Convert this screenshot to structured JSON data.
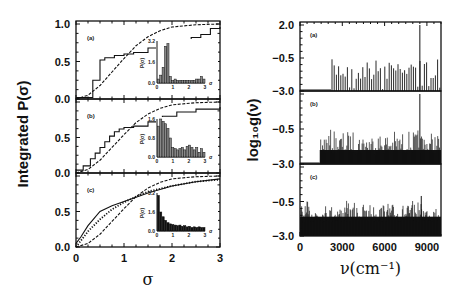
{
  "chart_data": [
    {
      "type": "line",
      "title": "",
      "xlabel": "σ",
      "ylabel": "Integrated P(σ)",
      "xlim": [
        0,
        3
      ],
      "ylim": [
        0,
        1
      ],
      "x_ticks": [
        "0",
        "1",
        "2",
        "3"
      ],
      "y_ticks": [
        "0.0",
        "0.5",
        "1.0"
      ],
      "grid": false,
      "panels": [
        {
          "label": "(a)",
          "series": [
            {
              "name": "integrated distribution (step)",
              "style": "step",
              "x": [
                0,
                0.2,
                0.35,
                0.5,
                0.6,
                0.8,
                1.0,
                1.2,
                1.5,
                1.8,
                2.1,
                2.4,
                2.6,
                2.8,
                3.0
              ],
              "y": [
                0.02,
                0.02,
                0.25,
                0.52,
                0.55,
                0.58,
                0.6,
                0.62,
                0.68,
                0.72,
                0.78,
                0.82,
                0.86,
                0.94,
                0.96
              ]
            },
            {
              "name": "Wigner reference (dashed)",
              "style": "dashed",
              "x": [
                0,
                0.25,
                0.5,
                0.75,
                1.0,
                1.25,
                1.5,
                1.75,
                2.0,
                2.5,
                3.0
              ],
              "y": [
                0,
                0.05,
                0.18,
                0.36,
                0.54,
                0.71,
                0.83,
                0.91,
                0.96,
                0.99,
                1.0
              ]
            }
          ],
          "inset": {
            "ylabel": "P(σ)",
            "xlabel": "σ",
            "y_ticks": [
              "0.0",
              "1.6",
              "3.2"
            ],
            "x_ticks": [
              "0",
              "1",
              "2",
              "3"
            ],
            "bars": [
              0.3,
              0.6,
              1.2,
              2.8,
              3.0,
              0.5,
              0.2,
              0.3,
              0.2,
              0.2,
              0.2,
              0.2,
              0.2,
              0.2,
              0.2,
              0.2,
              0.3,
              0.3,
              0.5,
              0.3
            ]
          }
        },
        {
          "label": "(b)",
          "series": [
            {
              "name": "integrated distribution (step)",
              "style": "step",
              "x": [
                0,
                0.15,
                0.3,
                0.4,
                0.5,
                0.6,
                0.7,
                0.8,
                0.9,
                1.0,
                1.2,
                1.5,
                1.8,
                2.1,
                2.5,
                3.0
              ],
              "y": [
                0.04,
                0.1,
                0.2,
                0.28,
                0.36,
                0.44,
                0.52,
                0.58,
                0.62,
                0.64,
                0.66,
                0.72,
                0.8,
                0.86,
                0.9,
                0.93
              ]
            },
            {
              "name": "Wigner reference (dashed)",
              "style": "dashed",
              "x": [
                0,
                0.25,
                0.5,
                0.75,
                1.0,
                1.25,
                1.5,
                1.75,
                2.0,
                2.5,
                3.0
              ],
              "y": [
                0,
                0.05,
                0.18,
                0.36,
                0.54,
                0.71,
                0.83,
                0.91,
                0.96,
                0.99,
                1.0
              ]
            }
          ],
          "inset": {
            "ylabel": "P(σ)",
            "xlabel": "σ",
            "y_ticks": [
              "0.0",
              "0.8",
              "1.6"
            ],
            "x_ticks": [
              "0",
              "1",
              "2",
              "3"
            ],
            "bars": [
              1.3,
              1.6,
              1.5,
              1.4,
              1.2,
              0.8,
              0.4,
              0.35,
              0.3,
              0.35,
              0.4,
              0.3,
              0.45,
              0.5,
              0.4,
              0.3,
              0.4,
              0.2,
              0.35,
              0.2
            ]
          }
        },
        {
          "label": "(c)",
          "series": [
            {
              "name": "integrated distribution (solid)",
              "style": "solid",
              "x": [
                0,
                0.1,
                0.25,
                0.5,
                0.75,
                1.0,
                1.25,
                1.5,
                2.0,
                2.5,
                3.0
              ],
              "y": [
                0.05,
                0.14,
                0.3,
                0.5,
                0.58,
                0.64,
                0.7,
                0.76,
                0.86,
                0.92,
                0.96
              ]
            },
            {
              "name": "Poisson reference (dotted)",
              "style": "dotted",
              "x": [
                0,
                0.25,
                0.5,
                0.75,
                1.0,
                1.25,
                1.5,
                2.0,
                2.5,
                3.0
              ],
              "y": [
                0,
                0.22,
                0.39,
                0.53,
                0.63,
                0.71,
                0.78,
                0.86,
                0.92,
                0.95
              ]
            },
            {
              "name": "Wigner reference (dashed)",
              "style": "dashed",
              "x": [
                0,
                0.25,
                0.5,
                0.75,
                1.0,
                1.25,
                1.5,
                1.75,
                2.0,
                2.5,
                3.0
              ],
              "y": [
                0,
                0.05,
                0.18,
                0.36,
                0.54,
                0.71,
                0.83,
                0.91,
                0.96,
                0.99,
                1.0
              ]
            }
          ],
          "inset": {
            "ylabel": "P(σ)",
            "xlabel": "σ",
            "y_ticks": [
              "0.0",
              "1.6",
              "3.2"
            ],
            "x_ticks": [
              "0",
              "1",
              "2",
              "3"
            ],
            "bars": [
              3.0,
              1.6,
              1.2,
              0.9,
              0.7,
              0.6,
              0.55,
              0.5,
              0.45,
              0.5,
              0.4,
              0.45,
              0.35,
              0.4,
              0.3,
              0.35,
              0.3,
              0.35,
              0.3,
              0.3
            ]
          }
        }
      ]
    },
    {
      "type": "bar",
      "title": "",
      "xlabel": "ν(cm⁻¹)",
      "ylabel": "log₁₀g(ν)",
      "xlim": [
        0,
        10000
      ],
      "ylim": [
        -3.0,
        2.0
      ],
      "x_ticks": [
        "0",
        "3000",
        "6000",
        "9000"
      ],
      "y_ticks": [
        "-3.0",
        "-0.5",
        "2.0"
      ],
      "grid": false,
      "panels": [
        {
          "label": "(a)",
          "onset": 2200,
          "density": "sparse",
          "typical_peak": -0.6,
          "max_peak": {
            "x": 8500,
            "y": 2.0
          }
        },
        {
          "label": "(b)",
          "onset": 1400,
          "density": "dense",
          "typical_peak": -0.5,
          "max_peak": {
            "x": 8500,
            "y": 2.0
          }
        },
        {
          "label": "(c)",
          "onset": 0,
          "density": "very dense",
          "typical_peak": -0.8,
          "max_peak": {
            "x": 8600,
            "y": -0.1
          }
        }
      ]
    }
  ]
}
